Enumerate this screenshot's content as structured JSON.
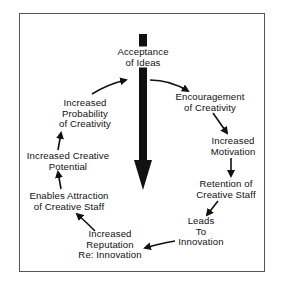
{
  "diagram": {
    "type": "cycle",
    "center_node": {
      "id": "acceptance",
      "lines": [
        "Acceptance",
        "of Ideas"
      ]
    },
    "nodes": [
      {
        "id": "encouragement",
        "lines": [
          "Encouragement",
          "of Creativity"
        ]
      },
      {
        "id": "motivation",
        "lines": [
          "Increased",
          "Motivation"
        ]
      },
      {
        "id": "retention",
        "lines": [
          "Retention of",
          "Creative Staff"
        ]
      },
      {
        "id": "innovation",
        "lines": [
          "Leads",
          "To",
          "Innovation"
        ]
      },
      {
        "id": "reputation",
        "lines": [
          "Increased",
          "Reputation",
          "Re: Innovation"
        ]
      },
      {
        "id": "attraction",
        "lines": [
          "Enables Attraction",
          "of Creative Staff"
        ]
      },
      {
        "id": "potential",
        "lines": [
          "Increased Creative",
          "Potential"
        ]
      },
      {
        "id": "probability",
        "lines": [
          "Increased",
          "Probability",
          "of Creativity"
        ]
      }
    ],
    "edges": [
      [
        "acceptance",
        "encouragement"
      ],
      [
        "encouragement",
        "motivation"
      ],
      [
        "motivation",
        "retention"
      ],
      [
        "retention",
        "innovation"
      ],
      [
        "innovation",
        "reputation"
      ],
      [
        "reputation",
        "attraction"
      ],
      [
        "attraction",
        "potential"
      ],
      [
        "potential",
        "probability"
      ],
      [
        "probability",
        "acceptance"
      ]
    ],
    "central_arrow": {
      "direction": "down",
      "from": "acceptance"
    },
    "colors": {
      "ink": "#111111",
      "frame": "#555555",
      "background": "#ffffff"
    }
  }
}
